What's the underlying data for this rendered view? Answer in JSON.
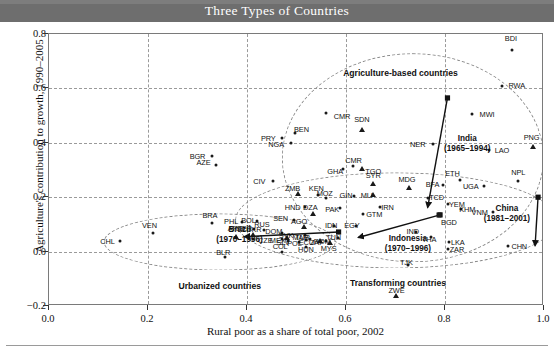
{
  "figure": {
    "title": "Three Types of Countries",
    "title_band_color": "#6e6e6e",
    "title_text_color": "#ffffff"
  },
  "chart_data": {
    "type": "scatter",
    "title": "Three Types of Countries",
    "xlabel": "Rural poor as a share of total poor, 2002",
    "ylabel": "Agriculture's contribution to growth, 1990–2005",
    "xlim": [
      0.0,
      1.0
    ],
    "ylim": [
      -0.2,
      0.8
    ],
    "xticks": [
      "0.0",
      "0.2",
      "0.4",
      "0.6",
      "0.8",
      "1.0"
    ],
    "yticks": [
      "−0.2",
      "0.0",
      "0.2",
      "0.4",
      "0.6",
      "0.8"
    ],
    "grid": true,
    "grid_style": "dashed",
    "legend": "none",
    "marker_colors": {
      "point": "#1a1a1a",
      "triangle": "#1a1a1a",
      "square": "#1a1a1a"
    },
    "groups": [
      {
        "name": "Agriculture-based countries",
        "label_x": 0.71,
        "label_y": 0.655,
        "ellipse_cx": 0.735,
        "ellipse_cy": 0.345,
        "ellipse_rx": 0.265,
        "ellipse_ry": 0.385
      },
      {
        "name": "Transforming countries",
        "label_x": 0.705,
        "label_y": -0.115,
        "ellipse_cx": 0.7,
        "ellipse_cy": 0.115,
        "ellipse_rx": 0.325,
        "ellipse_ry": 0.175
      },
      {
        "name": "Urbanized countries",
        "label_x": 0.345,
        "label_y": -0.125,
        "ellipse_cx": 0.345,
        "ellipse_cy": 0.035,
        "ellipse_rx": 0.235,
        "ellipse_ry": 0.105
      }
    ],
    "trajectories": [
      {
        "name": "India",
        "period": "(1965–1994)",
        "label_x": 0.845,
        "label_y": 0.395,
        "from": [
          0.805,
          0.565
        ],
        "to": [
          0.765,
          0.163
        ]
      },
      {
        "name": "China",
        "period": "(1981–2001)",
        "label_x": 0.925,
        "label_y": 0.14,
        "from": [
          0.988,
          0.2
        ],
        "to": [
          0.982,
          0.022
        ]
      },
      {
        "name": "Indonesia",
        "period": "(1970–1996)",
        "label_x": 0.725,
        "label_y": 0.028,
        "from": [
          0.79,
          0.135
        ],
        "to": [
          0.625,
          0.052
        ]
      },
      {
        "name": "Brazil",
        "period": "(1970–1996)",
        "label_x": 0.385,
        "label_y": 0.062,
        "from": [
          0.585,
          0.072
        ],
        "to": [
          0.395,
          0.055
        ]
      }
    ],
    "points": [
      {
        "code": "BDI",
        "x": 0.935,
        "y": 0.74,
        "marker": "point",
        "lx": 0.933,
        "ly": 0.785
      },
      {
        "code": "RWA",
        "x": 0.915,
        "y": 0.61,
        "marker": "point",
        "lx": 0.945,
        "ly": 0.612
      },
      {
        "code": "MWI",
        "x": 0.855,
        "y": 0.505,
        "marker": "point",
        "lx": 0.885,
        "ly": 0.507
      },
      {
        "code": "CMR",
        "x": 0.56,
        "y": 0.508,
        "marker": "point",
        "lx": 0.592,
        "ly": 0.498
      },
      {
        "code": "SDN",
        "x": 0.632,
        "y": 0.448,
        "marker": "triangle",
        "lx": 0.632,
        "ly": 0.487
      },
      {
        "code": "PRY",
        "x": 0.47,
        "y": 0.418,
        "marker": "point",
        "lx": 0.443,
        "ly": 0.418
      },
      {
        "code": "BEN",
        "x": 0.497,
        "y": 0.435,
        "marker": "point",
        "lx": 0.51,
        "ly": 0.449
      },
      {
        "code": "NGA",
        "x": 0.489,
        "y": 0.398,
        "marker": "point",
        "lx": 0.459,
        "ly": 0.397
      },
      {
        "code": "PNG",
        "x": 0.978,
        "y": 0.385,
        "marker": "triangle",
        "lx": 0.975,
        "ly": 0.42
      },
      {
        "code": "NER",
        "x": 0.775,
        "y": 0.397,
        "marker": "point",
        "lx": 0.745,
        "ly": 0.397
      },
      {
        "code": "LAO",
        "x": 0.888,
        "y": 0.375,
        "marker": "point",
        "lx": 0.915,
        "ly": 0.375
      },
      {
        "code": "BGR",
        "x": 0.329,
        "y": 0.352,
        "marker": "point",
        "lx": 0.3,
        "ly": 0.352
      },
      {
        "code": "AZE",
        "x": 0.337,
        "y": 0.317,
        "marker": "point",
        "lx": 0.312,
        "ly": 0.33
      },
      {
        "code": "GHA",
        "x": 0.593,
        "y": 0.305,
        "marker": "point",
        "lx": 0.578,
        "ly": 0.298
      },
      {
        "code": "TGO",
        "x": 0.632,
        "y": 0.305,
        "marker": "triangle",
        "lx": 0.655,
        "ly": 0.298
      },
      {
        "code": "CMR",
        "x": 0.615,
        "y": 0.313,
        "marker": "point",
        "lx": 0.615,
        "ly": 0.338
      },
      {
        "code": "NPL",
        "x": 0.948,
        "y": 0.258,
        "marker": "point",
        "lx": 0.948,
        "ly": 0.292
      },
      {
        "code": "UGA",
        "x": 0.878,
        "y": 0.243,
        "marker": "point",
        "lx": 0.852,
        "ly": 0.243
      },
      {
        "code": "ETH",
        "x": 0.83,
        "y": 0.262,
        "marker": "point",
        "lx": 0.815,
        "ly": 0.288
      },
      {
        "code": "BFA",
        "x": 0.795,
        "y": 0.245,
        "marker": "point",
        "lx": 0.775,
        "ly": 0.248
      },
      {
        "code": "CIV",
        "x": 0.453,
        "y": 0.258,
        "marker": "point",
        "lx": 0.425,
        "ly": 0.258
      },
      {
        "code": "SYR",
        "x": 0.655,
        "y": 0.25,
        "marker": "triangle",
        "lx": 0.655,
        "ly": 0.283
      },
      {
        "code": "MDG",
        "x": 0.728,
        "y": 0.235,
        "marker": "triangle",
        "lx": 0.723,
        "ly": 0.268
      },
      {
        "code": "ZMB",
        "x": 0.504,
        "y": 0.21,
        "marker": "triangle",
        "lx": 0.492,
        "ly": 0.233
      },
      {
        "code": "KEN",
        "x": 0.543,
        "y": 0.207,
        "marker": "point",
        "lx": 0.54,
        "ly": 0.232
      },
      {
        "code": "MOZ",
        "x": 0.56,
        "y": 0.197,
        "marker": "point",
        "lx": 0.557,
        "ly": 0.215
      },
      {
        "code": "GIN",
        "x": 0.617,
        "y": 0.205,
        "marker": "point",
        "lx": 0.6,
        "ly": 0.207
      },
      {
        "code": "MLI",
        "x": 0.655,
        "y": 0.207,
        "marker": "triangle",
        "lx": 0.642,
        "ly": 0.208
      },
      {
        "code": "TCD",
        "x": 0.765,
        "y": 0.198,
        "marker": "point",
        "lx": 0.783,
        "ly": 0.2
      },
      {
        "code": "YEM",
        "x": 0.806,
        "y": 0.175,
        "marker": "point",
        "lx": 0.824,
        "ly": 0.175
      },
      {
        "code": "VNM",
        "x": 0.896,
        "y": 0.147,
        "marker": "point",
        "lx": 0.87,
        "ly": 0.147
      },
      {
        "code": "KHM",
        "x": 0.832,
        "y": 0.155,
        "marker": "point",
        "lx": 0.845,
        "ly": 0.155
      },
      {
        "code": "HND",
        "x": 0.517,
        "y": 0.165,
        "marker": "point",
        "lx": 0.492,
        "ly": 0.165
      },
      {
        "code": "PAK",
        "x": 0.588,
        "y": 0.16,
        "marker": "point",
        "lx": 0.572,
        "ly": 0.158
      },
      {
        "code": "IRN",
        "x": 0.668,
        "y": 0.163,
        "marker": "point",
        "lx": 0.684,
        "ly": 0.163
      },
      {
        "code": "DZA",
        "x": 0.534,
        "y": 0.14,
        "marker": "triangle",
        "lx": 0.528,
        "ly": 0.165
      },
      {
        "code": "GTM",
        "x": 0.635,
        "y": 0.138,
        "marker": "point",
        "lx": 0.657,
        "ly": 0.138
      },
      {
        "code": "BGD",
        "x": 0.788,
        "y": 0.133,
        "marker": "square",
        "lx": 0.808,
        "ly": 0.108
      },
      {
        "code": "SEN",
        "x": 0.494,
        "y": 0.118,
        "marker": "point",
        "lx": 0.468,
        "ly": 0.125
      },
      {
        "code": "PHL",
        "x": 0.39,
        "y": 0.11,
        "marker": "point",
        "lx": 0.368,
        "ly": 0.112
      },
      {
        "code": "BOL",
        "x": 0.42,
        "y": 0.112,
        "marker": "point",
        "lx": 0.403,
        "ly": 0.115
      },
      {
        "code": "AGO",
        "x": 0.515,
        "y": 0.092,
        "marker": "triangle",
        "lx": 0.505,
        "ly": 0.112
      },
      {
        "code": "IDN",
        "x": 0.575,
        "y": 0.095,
        "marker": "point",
        "lx": 0.57,
        "ly": 0.097
      },
      {
        "code": "EGY",
        "x": 0.62,
        "y": 0.093,
        "marker": "point",
        "lx": 0.612,
        "ly": 0.097
      },
      {
        "code": "PER",
        "x": 0.414,
        "y": 0.082,
        "marker": "point",
        "lx": 0.395,
        "ly": 0.087
      },
      {
        "code": "BRA",
        "x": 0.33,
        "y": 0.105,
        "marker": "point",
        "lx": 0.325,
        "ly": 0.135
      },
      {
        "code": "ARG",
        "x": 0.378,
        "y": 0.055,
        "marker": "triangle",
        "lx": 0.377,
        "ly": 0.087
      },
      {
        "code": "RUS",
        "x": 0.435,
        "y": 0.08,
        "marker": "point",
        "lx": 0.43,
        "ly": 0.1
      },
      {
        "code": "UKR",
        "x": 0.413,
        "y": 0.062,
        "marker": "triangle",
        "lx": 0.414,
        "ly": 0.083
      },
      {
        "code": "CZE",
        "x": 0.413,
        "y": 0.048,
        "marker": "point",
        "lx": 0.437,
        "ly": 0.043
      },
      {
        "code": "VEN",
        "x": 0.21,
        "y": 0.068,
        "marker": "point",
        "lx": 0.203,
        "ly": 0.098
      },
      {
        "code": "CHL",
        "x": 0.143,
        "y": 0.04,
        "marker": "point",
        "lx": 0.118,
        "ly": 0.04
      },
      {
        "code": "MEX",
        "x": 0.47,
        "y": 0.045,
        "marker": "point",
        "lx": 0.462,
        "ly": 0.042
      },
      {
        "code": "SVK",
        "x": 0.48,
        "y": 0.05,
        "marker": "triangle",
        "lx": 0.479,
        "ly": 0.062
      },
      {
        "code": "DOM",
        "x": 0.471,
        "y": 0.07,
        "marker": "point",
        "lx": 0.454,
        "ly": 0.075
      },
      {
        "code": "SLV",
        "x": 0.482,
        "y": 0.038,
        "marker": "point",
        "lx": 0.473,
        "ly": 0.035
      },
      {
        "code": "TUR",
        "x": 0.528,
        "y": 0.048,
        "marker": "point",
        "lx": 0.512,
        "ly": 0.055
      },
      {
        "code": "POL",
        "x": 0.506,
        "y": 0.035,
        "marker": "point",
        "lx": 0.496,
        "ly": 0.03
      },
      {
        "code": "ECU",
        "x": 0.519,
        "y": 0.042,
        "marker": "point",
        "lx": 0.52,
        "ly": 0.037
      },
      {
        "code": "ZAF",
        "x": 0.548,
        "y": 0.038,
        "marker": "triangle",
        "lx": 0.541,
        "ly": 0.035
      },
      {
        "code": "MYS",
        "x": 0.568,
        "y": 0.033,
        "marker": "triangle",
        "lx": 0.565,
        "ly": 0.012
      },
      {
        "code": "HUN",
        "x": 0.52,
        "y": 0.018,
        "marker": "point",
        "lx": 0.519,
        "ly": 0.01
      },
      {
        "code": "COL",
        "x": 0.47,
        "y": 0.0,
        "marker": "point",
        "lx": 0.467,
        "ly": 0.02
      },
      {
        "code": "BLR",
        "x": 0.355,
        "y": -0.02,
        "marker": "point",
        "lx": 0.352,
        "ly": 0.0
      },
      {
        "code": "MAR",
        "x": 0.518,
        "y": 0.06,
        "marker": "point",
        "lx": 0.508,
        "ly": 0.055
      },
      {
        "code": "TUN",
        "x": 0.583,
        "y": 0.05,
        "marker": "point",
        "lx": 0.575,
        "ly": 0.055
      },
      {
        "code": "ROM",
        "x": 0.56,
        "y": 0.04,
        "marker": "point",
        "lx": 0.552,
        "ly": 0.04
      },
      {
        "code": "IND",
        "x": 0.742,
        "y": 0.072,
        "marker": "point",
        "lx": 0.735,
        "ly": 0.077
      },
      {
        "code": "THA",
        "x": 0.772,
        "y": 0.052,
        "marker": "point",
        "lx": 0.768,
        "ly": 0.048
      },
      {
        "code": "LKA",
        "x": 0.808,
        "y": 0.035,
        "marker": "point",
        "lx": 0.826,
        "ly": 0.035
      },
      {
        "code": "ZAR",
        "x": 0.806,
        "y": 0.01,
        "marker": "point",
        "lx": 0.824,
        "ly": 0.01
      },
      {
        "code": "CHN",
        "x": 0.928,
        "y": 0.02,
        "marker": "point",
        "lx": 0.95,
        "ly": 0.02
      },
      {
        "code": "TJK",
        "x": 0.725,
        "y": -0.048,
        "marker": "point",
        "lx": 0.722,
        "ly": -0.038
      },
      {
        "code": "ZWE",
        "x": 0.702,
        "y": -0.165,
        "marker": "triangle",
        "lx": 0.702,
        "ly": -0.14
      }
    ]
  }
}
